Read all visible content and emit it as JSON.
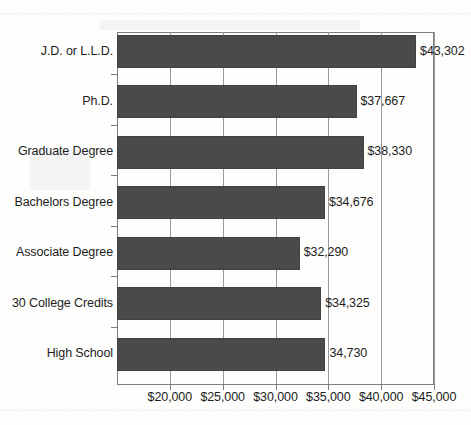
{
  "chart_data": {
    "type": "bar",
    "orientation": "horizontal",
    "title": "",
    "subtitle": "",
    "xlabel": "",
    "ylabel": "",
    "grid": true,
    "legend": false,
    "legend_position": "none",
    "xlim": [
      15000,
      45000
    ],
    "xticks": [
      20000,
      25000,
      30000,
      35000,
      40000,
      45000
    ],
    "xtick_labels": [
      "$20,000",
      "$25,000",
      "$30,000",
      "$35,000",
      "$40,000",
      "$45,000"
    ],
    "axis_origin_value": 15000,
    "axis_origin_labeled": false,
    "bar_color": "#4a4a4a",
    "background_color": "#fdfdfc",
    "categories": [
      "J.D. or L.L.D.",
      "Ph.D.",
      "Graduate Degree",
      "Bachelors Degree",
      "Associate Degree",
      "30 College Credits",
      "High School"
    ],
    "values": [
      43302,
      37667,
      38330,
      34676,
      32290,
      34325,
      34730
    ],
    "data_labels": [
      "$43,302",
      "$37,667",
      "$38,330",
      "$34,676",
      "$32,290",
      "$34,325",
      "34,730"
    ]
  },
  "bars": [
    {
      "label": "J.D. or L.L.D.",
      "value": 43302,
      "data_label": "$43,302"
    },
    {
      "label": "Ph.D.",
      "value": 37667,
      "data_label": "$37,667"
    },
    {
      "label": "Graduate Degree",
      "value": 38330,
      "data_label": "$38,330"
    },
    {
      "label": "Bachelors Degree",
      "value": 34676,
      "data_label": "$34,676"
    },
    {
      "label": "Associate Degree",
      "value": 32290,
      "data_label": "$32,290"
    },
    {
      "label": "30 College Credits",
      "value": 34325,
      "data_label": "$34,325"
    },
    {
      "label": "High School",
      "value": 34730,
      "data_label": "34,730"
    }
  ],
  "xaxis": {
    "ticks": [
      {
        "value": 20000,
        "label": "$20,000"
      },
      {
        "value": 25000,
        "label": "$25,000"
      },
      {
        "value": 30000,
        "label": "$30,000"
      },
      {
        "value": 35000,
        "label": "$35,000"
      },
      {
        "value": 40000,
        "label": "$40,000"
      },
      {
        "value": 45000,
        "label": "$45,000"
      }
    ]
  }
}
